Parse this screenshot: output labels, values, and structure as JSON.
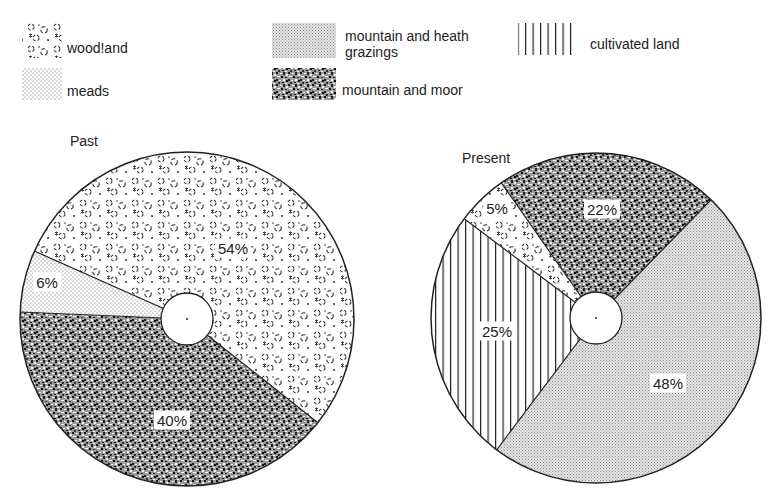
{
  "legend": [
    {
      "key": "woodland",
      "label": "wood!and",
      "pattern": "woodland",
      "swatch": [
        22,
        23,
        40,
        35
      ],
      "label_pos": [
        67,
        40
      ]
    },
    {
      "key": "meads",
      "label": "meads",
      "pattern": "meads",
      "swatch": [
        22,
        68,
        40,
        32
      ],
      "label_pos": [
        67,
        83
      ]
    },
    {
      "key": "grazings",
      "label": "mountain and heath\ngrazings",
      "pattern": "grazings",
      "swatch": [
        272,
        23,
        64,
        35
      ],
      "label_pos": [
        345,
        28
      ]
    },
    {
      "key": "moor",
      "label": "mountain and moor",
      "pattern": "moor",
      "swatch": [
        272,
        68,
        64,
        32
      ],
      "label_pos": [
        342,
        82
      ]
    },
    {
      "key": "cultivated",
      "label": "cultivated land",
      "pattern": "cultivated",
      "swatch": [
        518,
        23,
        56,
        32
      ],
      "label_pos": [
        590,
        36
      ]
    }
  ],
  "chart_data": [
    {
      "type": "pie",
      "title": "Past",
      "title_pos": [
        70,
        133
      ],
      "center": [
        187,
        319
      ],
      "radius": 167,
      "hole_radius": 26,
      "start_angle": 294,
      "slices": [
        {
          "key": "woodland",
          "label": "woodland",
          "value": 54,
          "text": "54%",
          "label_pos": [
            233,
            248
          ]
        },
        {
          "key": "moor",
          "label": "mountain and moor",
          "value": 40,
          "text": "40%",
          "label_pos": [
            172,
            420
          ]
        },
        {
          "key": "meads",
          "label": "meads",
          "value": 6,
          "text": "6%",
          "label_pos": [
            47,
            282
          ]
        }
      ]
    },
    {
      "type": "pie",
      "title": "Present",
      "title_pos": [
        462,
        150
      ],
      "center": [
        596,
        318
      ],
      "radius": 165,
      "hole_radius": 26,
      "start_angle": 325,
      "slices": [
        {
          "key": "moor",
          "label": "mountain and moor",
          "value": 22,
          "text": "22%",
          "label_pos": [
            602,
            209
          ]
        },
        {
          "key": "grazings",
          "label": "mountain and heath grazings",
          "value": 48,
          "text": "48%",
          "label_pos": [
            668,
            383
          ]
        },
        {
          "key": "cultivated",
          "label": "cultivated land",
          "value": 25,
          "text": "25%",
          "label_pos": [
            497,
            331
          ]
        },
        {
          "key": "woodland",
          "label": "woodland",
          "value": 5,
          "text": "5%",
          "label_pos": [
            497,
            208
          ]
        }
      ]
    }
  ]
}
